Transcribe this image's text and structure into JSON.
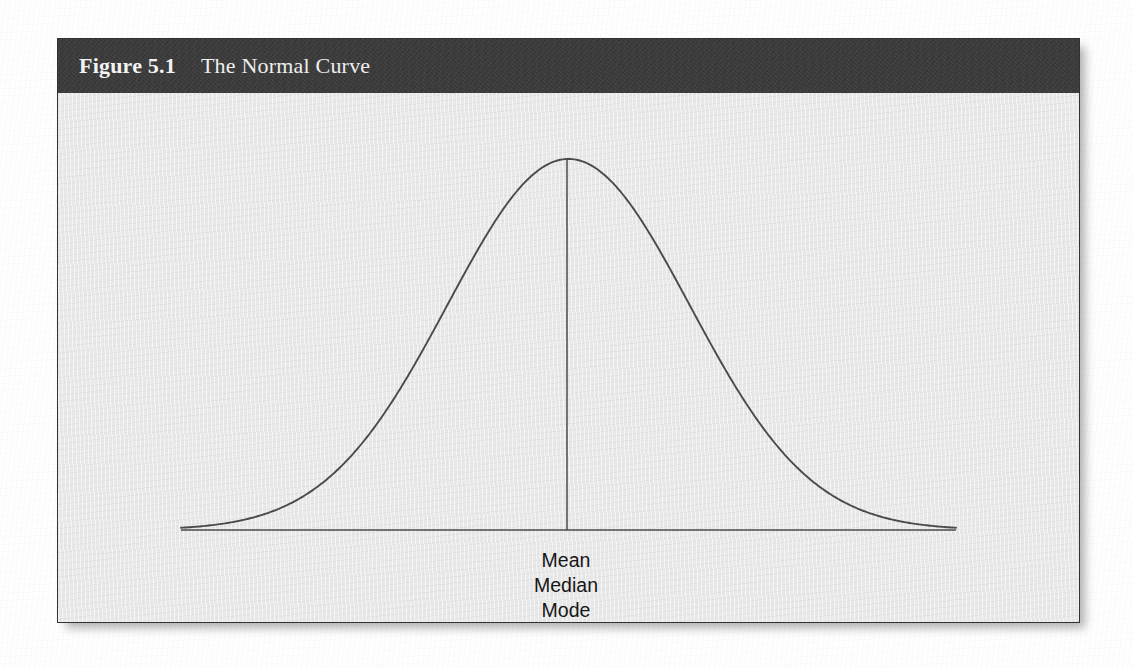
{
  "figure": {
    "number": "Figure 5.1",
    "title": "The Normal Curve",
    "header_bg": "#3b3b3b",
    "header_text_color": "#f4f4f4",
    "body_bg": "#e9e9e9",
    "border_color": "#31312f",
    "line_color": "#4a4a4a"
  },
  "labels": {
    "mean": "Mean",
    "median": "Median",
    "mode": "Mode"
  },
  "chart_data": {
    "type": "line",
    "title": "The Normal Curve",
    "xlabel": "",
    "ylabel": "",
    "grid": false,
    "legend": "none",
    "annotations": [
      "Mean",
      "Median",
      "Mode"
    ],
    "annotation_x": 0,
    "distribution": {
      "mean": 0,
      "sd": 1,
      "peak_density": 0.3989
    },
    "xlim": [
      -3.2,
      3.2
    ],
    "ylim": [
      0,
      0.42
    ],
    "x": [
      -3.2,
      -3.0,
      -2.8,
      -2.6,
      -2.4,
      -2.2,
      -2.0,
      -1.8,
      -1.6,
      -1.4,
      -1.2,
      -1.0,
      -0.8,
      -0.6,
      -0.4,
      -0.2,
      0.0,
      0.2,
      0.4,
      0.6,
      0.8,
      1.0,
      1.2,
      1.4,
      1.6,
      1.8,
      2.0,
      2.2,
      2.4,
      2.6,
      2.8,
      3.0,
      3.2
    ],
    "y": [
      0.0024,
      0.0044,
      0.0079,
      0.0136,
      0.0224,
      0.0355,
      0.054,
      0.079,
      0.1109,
      0.1497,
      0.1942,
      0.242,
      0.2897,
      0.3332,
      0.3683,
      0.391,
      0.3989,
      0.391,
      0.3683,
      0.3332,
      0.2897,
      0.242,
      0.1942,
      0.1497,
      0.1109,
      0.079,
      0.054,
      0.0355,
      0.0224,
      0.0136,
      0.0079,
      0.0044,
      0.0024
    ],
    "center_line": {
      "x": 0,
      "y_from": 0,
      "y_to": 0.3989
    },
    "baseline": {
      "y": 0,
      "x_from": -3.2,
      "x_to": 3.2
    }
  }
}
